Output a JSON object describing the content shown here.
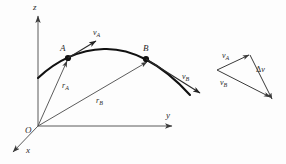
{
  "figure": {
    "background_color": "#fdfdfd",
    "line_color": "#333333",
    "curve_color": "#111111"
  },
  "axes": {
    "z_label": "z",
    "y_label": "y",
    "x_label": "x",
    "origin_label": "O"
  },
  "points": {
    "a_label": "A",
    "b_label": "B"
  },
  "position_vectors": [
    {
      "symbol": "r",
      "subscript": "A",
      "label": "rA"
    },
    {
      "symbol": "r",
      "subscript": "B",
      "label": "rB"
    }
  ],
  "velocity_vectors": [
    {
      "symbol": "v",
      "subscript": "A",
      "label": "vA"
    },
    {
      "symbol": "v",
      "subscript": "B",
      "label": "vB"
    }
  ],
  "vector_triangle": {
    "va_symbol": "v",
    "va_subscript": "A",
    "vb_symbol": "v",
    "vb_subscript": "B",
    "delta_symbol": "Δ",
    "delta_v_symbol": "v"
  }
}
